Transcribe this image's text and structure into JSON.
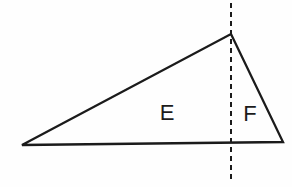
{
  "figure": {
    "type": "geometry-diagram",
    "canvas": {
      "width": 292,
      "height": 187,
      "background": "#fefefe"
    },
    "stroke_color": "#1b1b1b",
    "stroke_width": 2.3,
    "triangle": {
      "name": "triangle-outline",
      "vertices": [
        {
          "name": "left-vertex",
          "x": 22,
          "y": 145
        },
        {
          "name": "apex-vertex",
          "x": 231,
          "y": 34
        },
        {
          "name": "right-vertex",
          "x": 283,
          "y": 142
        }
      ],
      "path": "M 22 145 L 231 34 L 283 142 Z"
    },
    "dashed_line": {
      "name": "vertical-dashed-line",
      "x": 231,
      "y_start": 3,
      "y_end": 182,
      "dash": 5,
      "gap": 4,
      "stroke_width": 2,
      "color": "#1b1b1b"
    },
    "labels": [
      {
        "name": "region-label-e",
        "text": "E",
        "x": 167,
        "y": 120
      },
      {
        "name": "region-label-f",
        "text": "F",
        "x": 250,
        "y": 121
      }
    ]
  }
}
